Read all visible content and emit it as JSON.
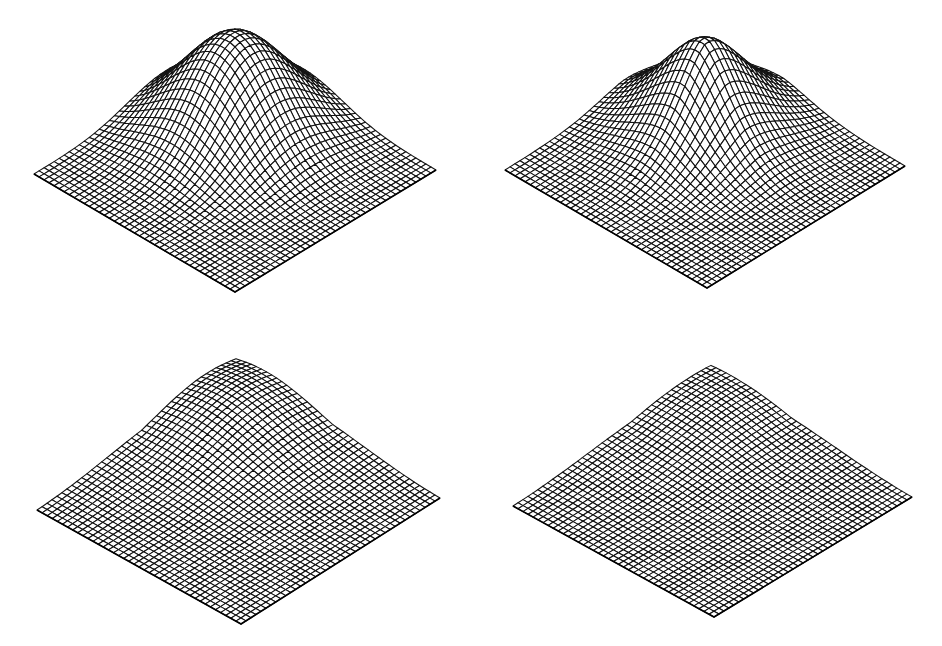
{
  "figure": {
    "background": "#ffffff",
    "line_color": "#111111",
    "grid_resolution": 40
  },
  "panels": [
    {
      "id": "top-left",
      "shape": "smooth rounded bump",
      "corners": {
        "left": [
          34,
          174
        ],
        "right": [
          436,
          170
        ],
        "front": [
          235,
          292
        ]
      },
      "peak_screen_y": 38,
      "height": 1.0,
      "center": [
        0.38,
        0.38
      ],
      "spread": [
        0.3,
        0.3
      ],
      "power": 2.0,
      "ridge": 0.0
    },
    {
      "id": "top-right",
      "shape": "sharper pointed peak",
      "corners": {
        "left": [
          505,
          170
        ],
        "right": [
          905,
          166
        ],
        "front": [
          707,
          288
        ]
      },
      "peak_screen_y": 38,
      "height": 1.0,
      "center": [
        0.4,
        0.4
      ],
      "spread": [
        0.26,
        0.26
      ],
      "power": 1.6,
      "ridge": 0.0
    },
    {
      "id": "bottom-left",
      "shape": "ridge rising toward back corner",
      "corners": {
        "left": [
          37,
          510
        ],
        "right": [
          440,
          498
        ],
        "front": [
          241,
          624
        ]
      },
      "peak_screen_y": 386,
      "height": 0.72,
      "center": [
        0.18,
        0.18
      ],
      "spread": [
        0.42,
        0.42
      ],
      "power": 2.0,
      "ridge": 0.55
    },
    {
      "id": "bottom-right",
      "shape": "flattened ridge with plateau at back",
      "corners": {
        "left": [
          513,
          506
        ],
        "right": [
          912,
          497
        ],
        "front": [
          714,
          617
        ]
      },
      "peak_screen_y": 381,
      "height": 0.62,
      "center": [
        0.12,
        0.12
      ],
      "spread": [
        0.46,
        0.46
      ],
      "power": 2.2,
      "ridge": 0.7
    }
  ]
}
